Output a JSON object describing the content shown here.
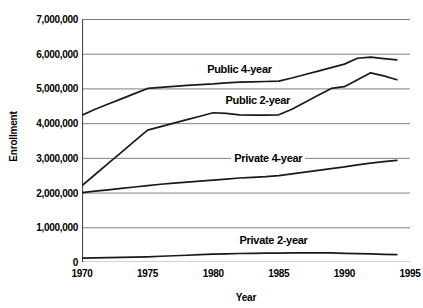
{
  "chart_data": {
    "type": "line",
    "title": "",
    "xlabel": "Year",
    "ylabel": "Enrollment",
    "xlim": [
      1970,
      1995
    ],
    "ylim": [
      0,
      7000000
    ],
    "grid": "horizontal",
    "legend_position": "inline-labels",
    "x_ticks": [
      "1970",
      "1975",
      "1980",
      "1985",
      "1990",
      "1995"
    ],
    "y_ticks": [
      "0",
      "1,000,000",
      "2,000,000",
      "3,000,000",
      "4,000,000",
      "5,000,000",
      "6,000,000",
      "7,000,000"
    ],
    "x": [
      1970,
      1971,
      1972,
      1973,
      1974,
      1975,
      1976,
      1977,
      1978,
      1979,
      1980,
      1981,
      1982,
      1983,
      1984,
      1985,
      1986,
      1987,
      1988,
      1989,
      1990,
      1991,
      1992,
      1993,
      1994
    ],
    "series": [
      {
        "name": "Public 4-year",
        "values": [
          4230000,
          4400000,
          4550000,
          4700000,
          4850000,
          5000000,
          5030000,
          5060000,
          5090000,
          5110000,
          5130000,
          5160000,
          5180000,
          5190000,
          5200000,
          5210000,
          5300000,
          5400000,
          5500000,
          5600000,
          5700000,
          5870000,
          5900000,
          5860000,
          5820000
        ]
      },
      {
        "name": "Public 2-year",
        "values": [
          2200000,
          2520000,
          2840000,
          3160000,
          3480000,
          3800000,
          3900000,
          4000000,
          4100000,
          4200000,
          4300000,
          4280000,
          4240000,
          4230000,
          4230000,
          4240000,
          4400000,
          4600000,
          4800000,
          5000000,
          5050000,
          5250000,
          5450000,
          5360000,
          5250000
        ]
      },
      {
        "name": "Private 4-year",
        "values": [
          2000000,
          2040000,
          2080000,
          2120000,
          2160000,
          2200000,
          2240000,
          2270000,
          2300000,
          2330000,
          2360000,
          2390000,
          2420000,
          2440000,
          2460000,
          2490000,
          2540000,
          2590000,
          2640000,
          2690000,
          2740000,
          2800000,
          2850000,
          2890000,
          2930000
        ]
      },
      {
        "name": "Private 2-year",
        "values": [
          110000,
          118000,
          126000,
          134000,
          142000,
          150000,
          165000,
          180000,
          195000,
          210000,
          225000,
          235000,
          245000,
          250000,
          255000,
          258000,
          260000,
          262000,
          263000,
          262000,
          250000,
          240000,
          232000,
          222000,
          215000
        ]
      }
    ],
    "series_label_positions": [
      {
        "label": "Public 4-year",
        "x": 1982.0,
        "y": 5550000
      },
      {
        "label": "Public 2-year",
        "x": 1983.4,
        "y": 4680000
      },
      {
        "label": "Private 4-year",
        "x": 1984.2,
        "y": 3000000
      },
      {
        "label": "Private 2-year",
        "x": 1984.6,
        "y": 620000
      }
    ],
    "line_color": "#1a1a1a",
    "grid_color": "#808080",
    "axis_color": "#4d4d4d",
    "background_color": "#ffffff"
  }
}
